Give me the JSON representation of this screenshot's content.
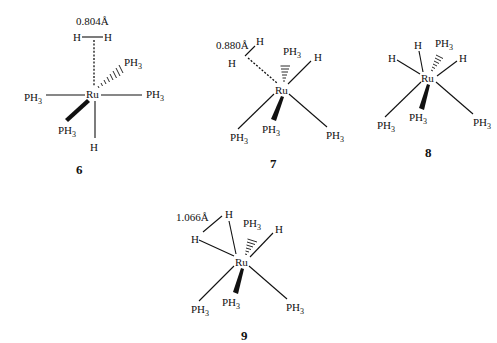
{
  "figure": {
    "background": "#ffffff",
    "ink": "#111111",
    "structures": [
      {
        "id": "6",
        "label": "6",
        "metal": "Ru",
        "distance_label": "0.804Å",
        "ligands": [
          "H",
          "H",
          "PH3",
          "PH3",
          "PH3",
          "PH3",
          "H"
        ],
        "h2_binding": "dashed (dihydrogen to Ru)"
      },
      {
        "id": "7",
        "label": "7",
        "metal": "Ru",
        "distance_label": "0.880Å",
        "ligands": [
          "H",
          "H",
          "PH3",
          "H",
          "PH3",
          "PH3",
          "PH3"
        ],
        "h2_binding": "dashed (dihydrogen to Ru)"
      },
      {
        "id": "8",
        "label": "8",
        "metal": "Ru",
        "distance_label": "",
        "ligands": [
          "H",
          "H",
          "PH3",
          "H",
          "PH3",
          "PH3",
          "PH3"
        ]
      },
      {
        "id": "9",
        "label": "9",
        "metal": "Ru",
        "distance_label": "1.066Å",
        "ligands": [
          "H",
          "H",
          "PH3",
          "H",
          "PH3",
          "PH3",
          "PH3"
        ]
      }
    ]
  },
  "text": {
    "ru": "Ru",
    "h": "H",
    "ph": "PH",
    "three": "3",
    "d6": "0.804Å",
    "d7": "0.880Å",
    "d9": "1.066Å",
    "n6": "6",
    "n7": "7",
    "n8": "8",
    "n9": "9"
  }
}
